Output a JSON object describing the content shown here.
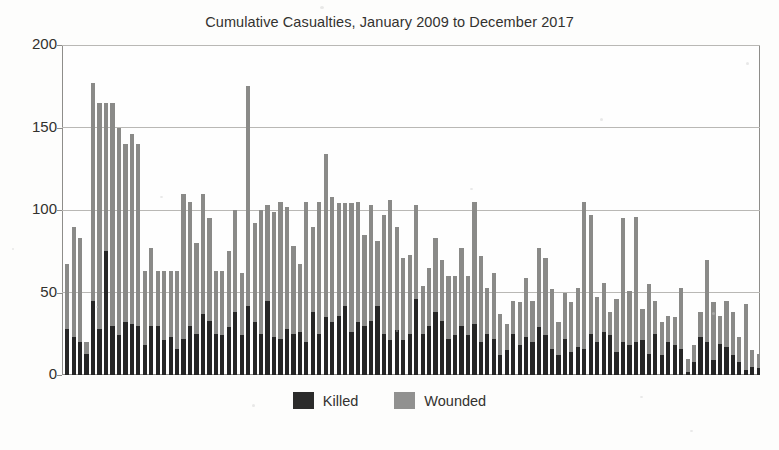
{
  "chart_data": {
    "type": "bar",
    "subtype": "stacked-column",
    "title": "Cumulative Casualties, January 2009 to December 2017",
    "xlabel": "",
    "ylabel": "",
    "ylim": [
      0,
      200
    ],
    "yticks": [
      0,
      50,
      100,
      150,
      200
    ],
    "ytick_labels": [
      "0",
      "50",
      "100",
      "150",
      "200"
    ],
    "grid": "horizontal",
    "legend_position": "bottom-center",
    "x_axis_visible_labels": false,
    "categories": [
      "Jan 2009",
      "Feb 2009",
      "Mar 2009",
      "Apr 2009",
      "May 2009",
      "Jun 2009",
      "Jul 2009",
      "Aug 2009",
      "Sep 2009",
      "Oct 2009",
      "Nov 2009",
      "Dec 2009",
      "Jan 2010",
      "Feb 2010",
      "Mar 2010",
      "Apr 2010",
      "May 2010",
      "Jun 2010",
      "Jul 2010",
      "Aug 2010",
      "Sep 2010",
      "Oct 2010",
      "Nov 2010",
      "Dec 2010",
      "Jan 2011",
      "Feb 2011",
      "Mar 2011",
      "Apr 2011",
      "May 2011",
      "Jun 2011",
      "Jul 2011",
      "Aug 2011",
      "Sep 2011",
      "Oct 2011",
      "Nov 2011",
      "Dec 2011",
      "Jan 2012",
      "Feb 2012",
      "Mar 2012",
      "Apr 2012",
      "May 2012",
      "Jun 2012",
      "Jul 2012",
      "Aug 2012",
      "Sep 2012",
      "Oct 2012",
      "Nov 2012",
      "Dec 2012",
      "Jan 2013",
      "Feb 2013",
      "Mar 2013",
      "Apr 2013",
      "May 2013",
      "Jun 2013",
      "Jul 2013",
      "Aug 2013",
      "Sep 2013",
      "Oct 2013",
      "Nov 2013",
      "Dec 2013",
      "Jan 2014",
      "Feb 2014",
      "Mar 2014",
      "Apr 2014",
      "May 2014",
      "Jun 2014",
      "Jul 2014",
      "Aug 2014",
      "Sep 2014",
      "Oct 2014",
      "Nov 2014",
      "Dec 2014",
      "Jan 2015",
      "Feb 2015",
      "Mar 2015",
      "Apr 2015",
      "May 2015",
      "Jun 2015",
      "Jul 2015",
      "Aug 2015",
      "Sep 2015",
      "Oct 2015",
      "Nov 2015",
      "Dec 2015",
      "Jan 2016",
      "Feb 2016",
      "Mar 2016",
      "Apr 2016",
      "May 2016",
      "Jun 2016",
      "Jul 2016",
      "Aug 2016",
      "Sep 2016",
      "Oct 2016",
      "Nov 2016",
      "Dec 2016",
      "Jan 2017",
      "Feb 2017",
      "Mar 2017",
      "Apr 2017",
      "May 2017",
      "Jun 2017",
      "Jul 2017",
      "Aug 2017",
      "Sep 2017",
      "Oct 2017",
      "Nov 2017",
      "Dec 2017"
    ],
    "series": [
      {
        "name": "Killed",
        "color": "#262626",
        "values": [
          28,
          23,
          20,
          13,
          45,
          28,
          75,
          30,
          24,
          32,
          31,
          30,
          18,
          30,
          30,
          21,
          23,
          16,
          22,
          30,
          25,
          37,
          33,
          25,
          24,
          29,
          38,
          24,
          42,
          32,
          25,
          45,
          23,
          22,
          28,
          25,
          26,
          20,
          38,
          25,
          35,
          32,
          36,
          42,
          26,
          32,
          30,
          33,
          42,
          25,
          21,
          27,
          21,
          25,
          46,
          25,
          30,
          38,
          33,
          22,
          24,
          30,
          24,
          31,
          20,
          25,
          22,
          12,
          15,
          25,
          18,
          23,
          20,
          29,
          24,
          16,
          12,
          22,
          14,
          17,
          16,
          25,
          20,
          26,
          24,
          14,
          20,
          18,
          20,
          21,
          13,
          25,
          12,
          20,
          18,
          16,
          2,
          8,
          23,
          20,
          9,
          19,
          17,
          12,
          8,
          3,
          5,
          4
        ]
      },
      {
        "name": "Wounded",
        "color": "#8a8a88",
        "values": [
          39,
          67,
          63,
          7,
          132,
          137,
          90,
          135,
          126,
          108,
          115,
          110,
          45,
          47,
          33,
          42,
          40,
          47,
          88,
          75,
          55,
          73,
          62,
          38,
          39,
          46,
          62,
          38,
          133,
          60,
          75,
          58,
          76,
          83,
          74,
          53,
          41,
          85,
          52,
          80,
          99,
          76,
          68,
          62,
          78,
          73,
          55,
          70,
          39,
          72,
          85,
          63,
          50,
          48,
          57,
          29,
          35,
          45,
          37,
          38,
          36,
          47,
          36,
          74,
          52,
          28,
          40,
          25,
          16,
          20,
          26,
          36,
          25,
          48,
          47,
          36,
          20,
          28,
          30,
          36,
          89,
          72,
          27,
          30,
          14,
          32,
          75,
          33,
          76,
          19,
          42,
          20,
          20,
          16,
          17,
          37,
          8,
          10,
          15,
          50,
          35,
          17,
          28,
          26,
          15,
          40,
          10,
          9
        ]
      }
    ]
  },
  "legend": {
    "items": [
      {
        "label": "Killed",
        "key": "killed"
      },
      {
        "label": "Wounded",
        "key": "wounded"
      }
    ]
  }
}
